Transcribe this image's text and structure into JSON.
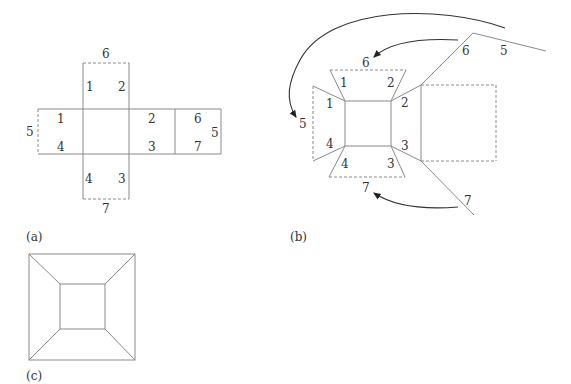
{
  "figures": {
    "a": {
      "caption": "(a)",
      "labels": {
        "top_face": [
          "1",
          "2"
        ],
        "top_edge": "6",
        "left_face": [
          "1",
          "4"
        ],
        "left_edge": "5",
        "right_face": [
          "2",
          "3"
        ],
        "far_right_face": [
          "6",
          "7"
        ],
        "far_right_edge": "5",
        "bottom_face": [
          "4",
          "3"
        ],
        "bottom_edge": "7"
      }
    },
    "b": {
      "caption": "(b)",
      "labels": {
        "peak_left": "6",
        "peak_right": "5",
        "arrow_target_6": "6",
        "arrow_target_5": "5",
        "top_trap": [
          "1",
          "2"
        ],
        "left_trap": [
          "1",
          "4"
        ],
        "right_corners": [
          "2",
          "3"
        ],
        "bottom_trap": [
          "4",
          "3"
        ],
        "arrow_target_7": "7",
        "diag_end": "7"
      }
    },
    "c": {
      "caption": "(c)"
    }
  }
}
